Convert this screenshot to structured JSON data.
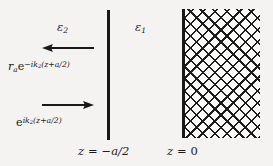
{
  "figure": {
    "name": "dielectric-interface-wave-diagram",
    "background_color": "#f4f3f1",
    "ink_color": "#181818",
    "width": 273,
    "height": 166
  },
  "regions": {
    "left_medium": {
      "symbol": "ε",
      "subscript": "2",
      "label": "ε₂",
      "description": "left half-space permittivity"
    },
    "middle_medium": {
      "symbol": "ε",
      "subscript": "1",
      "label": "ε₁",
      "description": "middle region permittivity"
    }
  },
  "waves": {
    "reflected": {
      "amplitude_symbol": "r",
      "amplitude_subscript": "a",
      "exponent_sign": "−",
      "exponent_i": "i",
      "exponent_k": "k",
      "exponent_k_subscript": "2",
      "exponent_arg": "(z+a/2)",
      "full_label": "r_a e^{-ik_2(z+a/2)}",
      "direction": "left"
    },
    "incident": {
      "exponent_i": "i",
      "exponent_k": "k",
      "exponent_k_subscript": "2",
      "exponent_arg": "(z+a/2)",
      "full_label": "e^{ik_2(z+a/2)}",
      "direction": "right"
    }
  },
  "axis_labels": {
    "interface": {
      "variable": "z",
      "equals": "=",
      "value": "−a/2",
      "full_label": "z = −a/2"
    },
    "slab_face": {
      "variable": "z",
      "equals": "=",
      "value": "0",
      "full_label": "z = 0"
    }
  },
  "slab": {
    "name": "hatched-dielectric-slab",
    "pattern": "cross-hatch",
    "fill_color": "#fbfbfa",
    "hatch_color": "#1c1c1c"
  }
}
